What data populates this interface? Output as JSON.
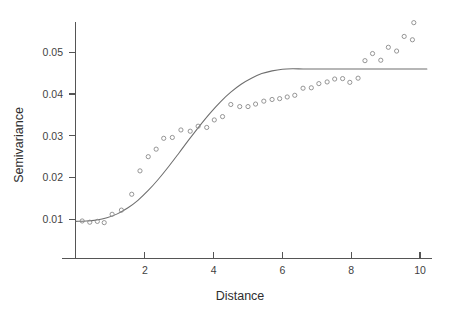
{
  "figure": {
    "background_color": "#ffffff",
    "width": 450,
    "height": 312
  },
  "axes": {
    "x_title": "Distance",
    "y_title": "Semivariance",
    "x_ticks": [
      "2",
      "4",
      "6",
      "8",
      "10"
    ],
    "y_ticks": [
      "0.01",
      "0.02",
      "0.03",
      "0.04",
      "0.05"
    ],
    "axis_color": "#555555",
    "label_color": "#2e2e2e"
  },
  "chart_data": {
    "type": "scatter",
    "title": "",
    "subtitle": "",
    "xlabel": "Distance",
    "ylabel": "Semivariance",
    "xlim": [
      0,
      10.4
    ],
    "ylim": [
      0.0,
      0.0595
    ],
    "xticks": [
      2,
      4,
      6,
      8,
      10
    ],
    "yticks": [
      0.01,
      0.02,
      0.03,
      0.04,
      0.05
    ],
    "grid": false,
    "legend": null,
    "annotations": [],
    "series": [
      {
        "name": "Empirical semivariance",
        "type": "scatter",
        "marker": "open-circle",
        "color": "#8a8a8a",
        "x": [
          0.18,
          0.4,
          0.62,
          0.82,
          1.05,
          1.32,
          1.62,
          1.86,
          2.1,
          2.33,
          2.55,
          2.8,
          3.05,
          3.32,
          3.55,
          3.8,
          4.02,
          4.26,
          4.5,
          4.76,
          5.0,
          5.22,
          5.46,
          5.7,
          5.92,
          6.14,
          6.36,
          6.6,
          6.84,
          7.06,
          7.3,
          7.52,
          7.75,
          7.96,
          8.2,
          8.4,
          8.62,
          8.86,
          9.08,
          9.32,
          9.54,
          9.78
        ],
        "y": [
          0.0096,
          0.0093,
          0.0095,
          0.0092,
          0.0112,
          0.0122,
          0.016,
          0.0216,
          0.025,
          0.0268,
          0.0294,
          0.0296,
          0.0314,
          0.0311,
          0.0323,
          0.032,
          0.0338,
          0.0346,
          0.0375,
          0.037,
          0.037,
          0.0376,
          0.0383,
          0.0387,
          0.0389,
          0.0393,
          0.0397,
          0.0414,
          0.0415,
          0.0425,
          0.0429,
          0.0436,
          0.0437,
          0.0428,
          0.0438,
          0.048,
          0.0497,
          0.0481,
          0.0512,
          0.0503,
          0.0538,
          0.053
        ],
        "extra_points": [
          {
            "x": 9.82,
            "y": 0.0571
          }
        ]
      },
      {
        "name": "Fitted variogram model",
        "type": "line",
        "color": "#6e6e6e",
        "model": "gaussian-like sigmoid",
        "nugget": 0.0095,
        "sill": 0.046,
        "range": 7.0,
        "x": [
          0.0,
          0.3,
          0.6,
          0.9,
          1.2,
          1.5,
          1.8,
          2.1,
          2.4,
          2.7,
          3.0,
          3.3,
          3.6,
          3.9,
          4.2,
          4.5,
          4.8,
          5.1,
          5.4,
          5.7,
          6.0,
          6.3,
          6.6,
          6.9,
          7.2,
          7.5,
          7.8,
          8.1,
          8.4,
          8.7,
          9.0,
          9.3,
          9.6,
          9.9,
          10.2
        ],
        "y": [
          0.0095,
          0.00958,
          0.00985,
          0.0104,
          0.0113,
          0.0127,
          0.01455,
          0.0169,
          0.01965,
          0.0227,
          0.02595,
          0.02925,
          0.03245,
          0.03545,
          0.03815,
          0.04045,
          0.04235,
          0.0438,
          0.0449,
          0.04555,
          0.04595,
          0.04605,
          0.046,
          0.046,
          0.046,
          0.046,
          0.046,
          0.046,
          0.046,
          0.046,
          0.046,
          0.046,
          0.046,
          0.046,
          0.046
        ]
      }
    ]
  }
}
